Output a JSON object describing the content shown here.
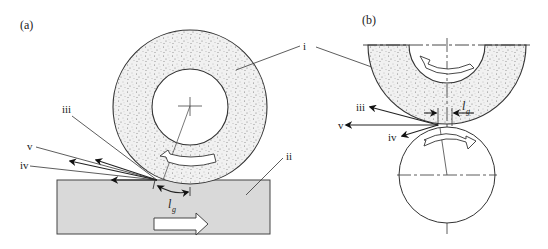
{
  "figure": {
    "panel_a": {
      "label": "(a)",
      "callouts": {
        "wheel": "i",
        "workpiece": "ii",
        "chip_dir_1": "iii",
        "chip_dir_2": "iv",
        "chip_dir_3": "v"
      },
      "contact_length": {
        "symbol": "l",
        "subscript": "g"
      },
      "feed_arrow": "right"
    },
    "panel_b": {
      "label": "(b)",
      "callouts": {
        "wheel": "i",
        "chip_dir_1": "iii",
        "chip_dir_2": "iv",
        "chip_dir_3": "v"
      },
      "contact_length": {
        "symbol": "l",
        "subscript": "g"
      }
    },
    "colors": {
      "wheel_fill": "#efefef",
      "workpiece_fill": "#d9d9d9",
      "line": "#333333"
    }
  }
}
